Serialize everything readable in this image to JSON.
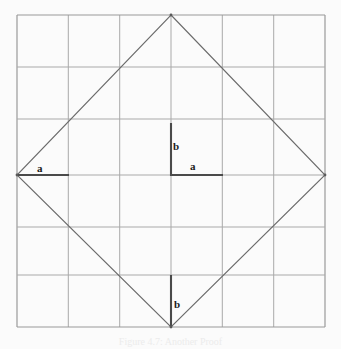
{
  "figure": {
    "kind": "geometry-diagram",
    "background_color": "#fbfbfb",
    "grid": {
      "rows": 6,
      "cols": 6,
      "x0": 17,
      "y0": 15,
      "x1": 325,
      "y1": 327,
      "cell_size": 51.33,
      "line_color": "#a9a9a9",
      "border_color": "#9a9a9a",
      "line_width": 1
    },
    "diamond": {
      "stroke_color": "#6b6b6b",
      "line_width": 1,
      "vertices": [
        {
          "name": "top",
          "x": 171,
          "y": 15
        },
        {
          "name": "right",
          "x": 325,
          "y": 175
        },
        {
          "name": "bottom",
          "x": 171,
          "y": 327
        },
        {
          "name": "left",
          "x": 17,
          "y": 175
        }
      ]
    },
    "emphasis_segments": [
      {
        "name": "left-a-segment",
        "orientation": "horizontal",
        "x1": 17,
        "y1": 175,
        "x2": 69,
        "y2": 175,
        "color": "#4a4a4a",
        "width": 2
      },
      {
        "name": "center-a-segment",
        "orientation": "horizontal",
        "x1": 171,
        "y1": 175,
        "x2": 223,
        "y2": 175,
        "color": "#4a4a4a",
        "width": 2
      },
      {
        "name": "center-b-segment",
        "orientation": "vertical",
        "x1": 171,
        "y1": 123,
        "x2": 171,
        "y2": 175,
        "color": "#4a4a4a",
        "width": 2
      },
      {
        "name": "bottom-b-segment",
        "orientation": "vertical",
        "x1": 171,
        "y1": 275,
        "x2": 171,
        "y2": 327,
        "color": "#4a4a4a",
        "width": 2
      }
    ],
    "labels": [
      {
        "name": "label-a-left",
        "text": "a",
        "x": 37,
        "y": 163
      },
      {
        "name": "label-b-center",
        "text": "b",
        "x": 173,
        "y": 141
      },
      {
        "name": "label-a-center",
        "text": "a",
        "x": 190,
        "y": 161
      },
      {
        "name": "label-b-bottom",
        "text": "b",
        "x": 174,
        "y": 299
      }
    ],
    "caption": "Figure 4.7: Another Proof"
  }
}
